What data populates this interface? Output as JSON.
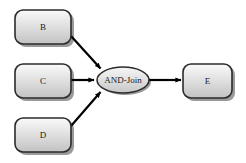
{
  "diagram": {
    "type": "workflow-and-join",
    "background_color": "#ffffff",
    "node_fill_light": "#f3f3f3",
    "node_fill_dark": "#bdbdbd",
    "node_stroke": "#2b2b2b",
    "connector_color": "#000000",
    "shadow_color": "#9a9a9a",
    "nodes": [
      {
        "id": "B",
        "label": "B",
        "shape": "rounded-rectangle",
        "x": 15,
        "y": 10,
        "width": 56,
        "height": 34
      },
      {
        "id": "C",
        "label": "C",
        "shape": "rounded-rectangle",
        "x": 15,
        "y": 64,
        "width": 56,
        "height": 34
      },
      {
        "id": "D",
        "label": "D",
        "shape": "rounded-rectangle",
        "x": 15,
        "y": 118,
        "width": 56,
        "height": 34
      },
      {
        "id": "E",
        "label": "E",
        "shape": "rounded-rectangle",
        "x": 183,
        "y": 64,
        "width": 49,
        "height": 34
      }
    ],
    "gateway": {
      "id": "AND-Join",
      "label": "AND-Join",
      "shape": "ellipse",
      "cx": 123,
      "cy": 80,
      "rx": 26,
      "ry": 13
    },
    "connectors": [
      {
        "id": "b-to-join",
        "from": "B",
        "to": "AND-Join",
        "x1": 71,
        "y1": 36,
        "x2": 102,
        "y2": 70
      },
      {
        "id": "c-to-join",
        "from": "C",
        "to": "AND-Join",
        "x1": 71,
        "y1": 80,
        "x2": 96,
        "y2": 80
      },
      {
        "id": "d-to-join",
        "from": "D",
        "to": "AND-Join",
        "x1": 71,
        "y1": 126,
        "x2": 102,
        "y2": 91
      },
      {
        "id": "join-to-e",
        "from": "AND-Join",
        "to": "E",
        "x1": 149,
        "y1": 80,
        "x2": 182,
        "y2": 80
      }
    ]
  }
}
